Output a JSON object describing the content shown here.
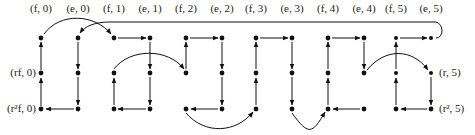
{
  "diagram": {
    "type": "cayley-graph",
    "top_labels": [
      "(f, 0)",
      "(e, 0)",
      "(f, 1)",
      "(e, 1)",
      "(f, 2)",
      "(e, 2)",
      "(f, 3)",
      "(e, 3)",
      "(f, 4)",
      "(e, 4)",
      "(f, 5)",
      "(e, 5)"
    ],
    "side_labels": {
      "left_mid": "(rf, 0)",
      "left_bottom": "(r²f, 0)",
      "right_mid": "(r, 5)",
      "right_bottom": "(r², 5)"
    },
    "columns_x": [
      41,
      78,
      114,
      150,
      186,
      222,
      256,
      292,
      328,
      364,
      396,
      431
    ],
    "rows_y": [
      38,
      73,
      109
    ],
    "colors": {
      "ink": "#111111",
      "background": "#ffffff"
    }
  }
}
